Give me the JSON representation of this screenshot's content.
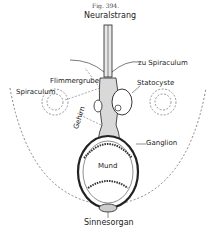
{
  "figure": {
    "caption": "Fig. 394.",
    "labels": {
      "top": "Neuralstrang",
      "to_spiracle": "zu Spiraculum",
      "ciliated_pit": "Flimmergrube",
      "statocyst": "Statocyste",
      "spiracle": "Spiraculum",
      "brain": "Gehirn",
      "ganglion": "Ganglion",
      "mouth": "Mund",
      "sense_organ": "Sinnesorgan"
    },
    "colors": {
      "ink": "#222222",
      "background": "#ffffff",
      "dashed": "#555555"
    }
  }
}
